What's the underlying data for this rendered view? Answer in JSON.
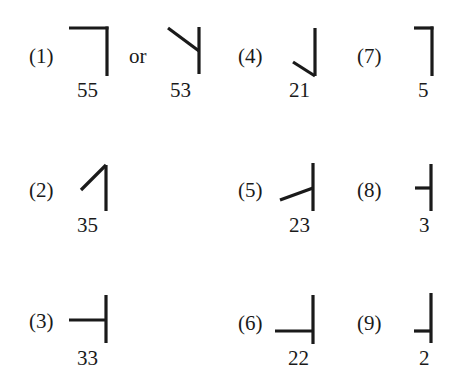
{
  "diagram": {
    "connector_text": "or",
    "items": [
      {
        "index_label": "(1)",
        "glyphs": [
          {
            "code": "55",
            "shape": "top-horizontal-with-right-vertical"
          },
          {
            "code": "53",
            "shape": "top-left-diagonal-into-vertical"
          }
        ]
      },
      {
        "index_label": "(2)",
        "glyphs": [
          {
            "code": "35",
            "shape": "left-diagonal-rising-to-vertical-top"
          }
        ]
      },
      {
        "index_label": "(3)",
        "glyphs": [
          {
            "code": "33",
            "shape": "long-horizontal-meeting-vertical-middle"
          }
        ]
      },
      {
        "index_label": "(4)",
        "glyphs": [
          {
            "code": "21",
            "shape": "left-diagonal-into-vertical-bottom"
          }
        ]
      },
      {
        "index_label": "(5)",
        "glyphs": [
          {
            "code": "23",
            "shape": "rising-diagonal-meeting-vertical-middle"
          }
        ]
      },
      {
        "index_label": "(6)",
        "glyphs": [
          {
            "code": "22",
            "shape": "long-horizontal-meeting-vertical-lower"
          }
        ]
      },
      {
        "index_label": "(7)",
        "glyphs": [
          {
            "code": "5",
            "shape": "short-top-horizontal-with-vertical"
          }
        ]
      },
      {
        "index_label": "(8)",
        "glyphs": [
          {
            "code": "3",
            "shape": "short-horizontal-meeting-vertical-middle"
          }
        ]
      },
      {
        "index_label": "(9)",
        "glyphs": [
          {
            "code": "2",
            "shape": "short-horizontal-meeting-vertical-lower"
          }
        ]
      }
    ],
    "colors": {
      "ink": "#1a1a1a",
      "background": "#ffffff"
    }
  }
}
